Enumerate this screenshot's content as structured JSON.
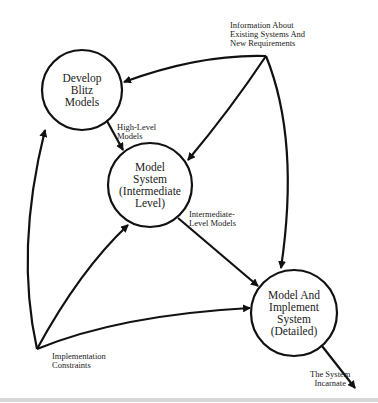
{
  "diagram": {
    "nodes": [
      {
        "id": "blitz",
        "label": "Develop\nBlitz\nModels",
        "cx": 82,
        "cy": 90,
        "r": 40
      },
      {
        "id": "intermediate",
        "label": "Model\nSystem\n(Intermediate\nLevel)",
        "cx": 150,
        "cy": 185,
        "r": 42
      },
      {
        "id": "detailed",
        "label": "Model And\nImplement\nSystem\n(Detailed)",
        "cx": 294,
        "cy": 313,
        "r": 43
      }
    ],
    "sources": [
      {
        "id": "information",
        "label": "Information About\nExisting Systems And\nNew Requirements"
      },
      {
        "id": "constraints",
        "label": "Implementation\nConstraints"
      }
    ],
    "edge_labels": {
      "high_level": "High-Level\nModels",
      "intermediate_level": "Intermediate-\nLevel Models",
      "output": "The System\nIncarnate"
    },
    "edges": [
      {
        "from": "information",
        "to": "blitz"
      },
      {
        "from": "information",
        "to": "intermediate"
      },
      {
        "from": "information",
        "to": "detailed"
      },
      {
        "from": "constraints",
        "to": "blitz"
      },
      {
        "from": "constraints",
        "to": "intermediate"
      },
      {
        "from": "constraints",
        "to": "detailed"
      },
      {
        "from": "blitz",
        "to": "intermediate",
        "label": "High-Level Models"
      },
      {
        "from": "intermediate",
        "to": "detailed",
        "label": "Intermediate-Level Models"
      },
      {
        "from": "detailed",
        "to": "output",
        "label": "The System Incarnate"
      }
    ],
    "colors": {
      "stroke": "#111111",
      "background": "#ffffff"
    }
  }
}
